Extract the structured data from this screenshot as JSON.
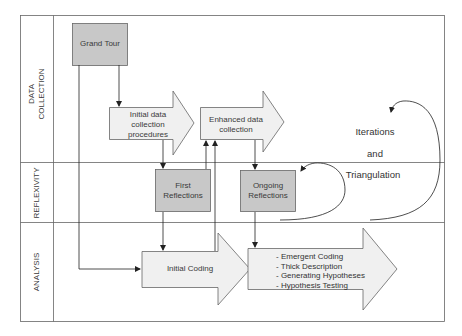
{
  "rows": [
    {
      "label_lines": [
        "DATA",
        "COLLECTION"
      ]
    },
    {
      "label": "REFLEXIVITY"
    },
    {
      "label": "ANALYSIS"
    }
  ],
  "nodes": {
    "grand_tour": "Grand Tour",
    "initial_data": [
      "Initial data",
      "collection",
      "procedures"
    ],
    "enhanced_data": [
      "Enhanced data",
      "collection"
    ],
    "first_reflections": [
      "First",
      "Reflections"
    ],
    "ongoing_reflections": [
      "Ongoing",
      "Reflections"
    ],
    "initial_coding": "Initial Coding",
    "analysis_items": [
      "- Emergent Coding",
      "- Thick Description",
      "- Generating Hypotheses",
      "- Hypothesis Testing"
    ]
  },
  "annotations": {
    "iterations": "Iterations",
    "and": "and",
    "triangulation": "Triangulation"
  },
  "colors": {
    "box_fill": "#c8c8c8",
    "arrow_fill": "#f0f0f0",
    "stroke": "#555555"
  }
}
